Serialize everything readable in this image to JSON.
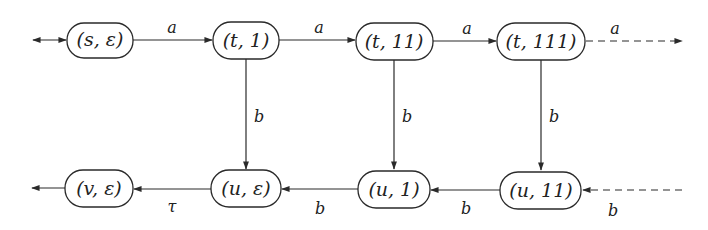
{
  "diagram": {
    "title": "",
    "nodes": [
      {
        "id": "s_eps",
        "label": "(s, ε)",
        "x": 100,
        "y": 40,
        "w": 66,
        "h": 35
      },
      {
        "id": "t_1",
        "label": "(t, 1)",
        "x": 246,
        "y": 40,
        "w": 66,
        "h": 37
      },
      {
        "id": "t_11",
        "label": "(t, 11)",
        "x": 394,
        "y": 41,
        "w": 77,
        "h": 37
      },
      {
        "id": "t_111",
        "label": "(t, 111)",
        "x": 541,
        "y": 41,
        "w": 88,
        "h": 37
      },
      {
        "id": "v_eps",
        "label": "(v, ε)",
        "x": 99,
        "y": 188,
        "w": 68,
        "h": 37
      },
      {
        "id": "u_eps",
        "label": "(u, ε)",
        "x": 246,
        "y": 189,
        "w": 70,
        "h": 37
      },
      {
        "id": "u_1",
        "label": "(u, 1)",
        "x": 394,
        "y": 189,
        "w": 72,
        "h": 37
      },
      {
        "id": "u_11",
        "label": "(u, 11)",
        "x": 541,
        "y": 190,
        "w": 81,
        "h": 37
      }
    ],
    "edges": [
      {
        "id": "init",
        "from": "start",
        "to": "s_eps",
        "label": "",
        "style": "solid",
        "note": "double-headed initial/final arrow"
      },
      {
        "id": "s_t1",
        "from": "s_eps",
        "to": "t_1",
        "label": "a",
        "style": "solid"
      },
      {
        "id": "t1_t11",
        "from": "t_1",
        "to": "t_11",
        "label": "a",
        "style": "solid"
      },
      {
        "id": "t11_t111",
        "from": "t_11",
        "to": "t_111",
        "label": "a",
        "style": "solid"
      },
      {
        "id": "t111_more",
        "from": "t_111",
        "to": "…",
        "label": "a",
        "style": "dashed"
      },
      {
        "id": "t1_ueps",
        "from": "t_1",
        "to": "u_eps",
        "label": "b",
        "style": "solid"
      },
      {
        "id": "t11_u1",
        "from": "t_11",
        "to": "u_1",
        "label": "b",
        "style": "solid"
      },
      {
        "id": "t111_u11",
        "from": "t_111",
        "to": "u_11",
        "label": "b",
        "style": "solid"
      },
      {
        "id": "more_u11",
        "from": "…",
        "to": "u_11",
        "label": "b",
        "style": "dashed"
      },
      {
        "id": "u11_u1",
        "from": "u_11",
        "to": "u_1",
        "label": "b",
        "style": "solid"
      },
      {
        "id": "u1_ueps",
        "from": "u_1",
        "to": "u_eps",
        "label": "b",
        "style": "solid"
      },
      {
        "id": "ueps_veps",
        "from": "u_eps",
        "to": "v_eps",
        "label": "τ",
        "style": "solid"
      },
      {
        "id": "veps_out",
        "from": "v_eps",
        "to": "end",
        "label": "",
        "style": "solid"
      }
    ],
    "edge_labels": {
      "s_t1": "a",
      "t1_t11": "a",
      "t11_t111": "a",
      "t111_more": "a",
      "t1_ueps": "b",
      "t11_u1": "b",
      "t111_u11": "b",
      "u11_u1": "b",
      "u1_ueps": "b",
      "more_u11": "b",
      "ueps_veps": "τ"
    },
    "node_labels": {
      "s_eps": "(s, ε)",
      "t_1": "(t, 1)",
      "t_11": "(t, 11)",
      "t_111": "(t, 111)",
      "v_eps": "(v, ε)",
      "u_eps": "(u, ε)",
      "u_1": "(u, 1)",
      "u_11": "(u, 11)"
    },
    "colors": {
      "stroke": "#2a2a2a",
      "background": "#ffffff"
    }
  }
}
